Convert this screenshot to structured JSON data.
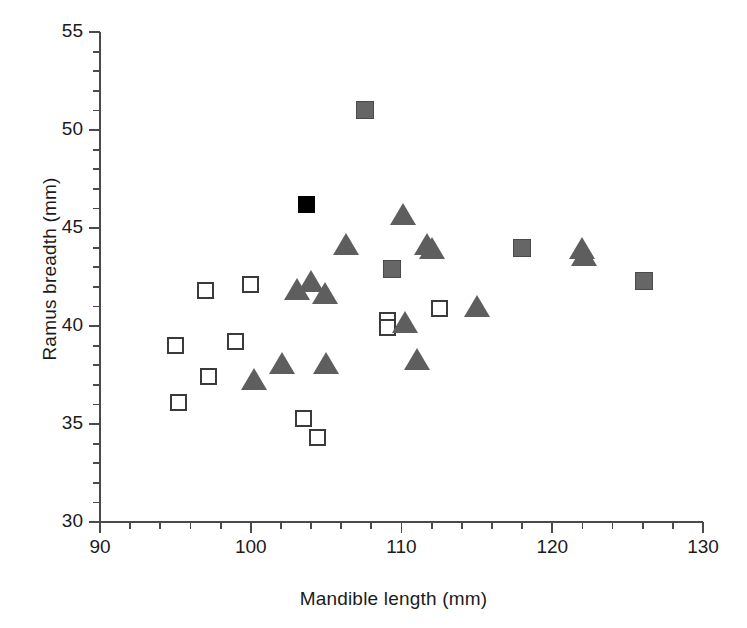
{
  "chart_data": {
    "type": "scatter",
    "title": "",
    "xlabel": "Mandible length (mm)",
    "ylabel": "Ramus breadth (mm)",
    "xlim": [
      90,
      130
    ],
    "ylim": [
      30,
      55
    ],
    "x_major_ticks": [
      90,
      100,
      110,
      120,
      130
    ],
    "x_minor_tick_interval": 2,
    "y_major_ticks": [
      30,
      35,
      40,
      45,
      50,
      55
    ],
    "y_minor_tick_interval": 1,
    "x_tick_labels": [
      "90",
      "100",
      "110",
      "120",
      "130"
    ],
    "y_tick_labels": [
      "30",
      "35",
      "40",
      "45",
      "50",
      "55"
    ],
    "grid": false,
    "legend": "none",
    "series": [
      {
        "name": "open-square",
        "marker": "square",
        "fill": "#ffffff",
        "edge": "#3a3a3a",
        "points": [
          [
            95.0,
            39.0
          ],
          [
            95.2,
            36.1
          ],
          [
            97.0,
            41.8
          ],
          [
            97.2,
            37.4
          ],
          [
            99.0,
            39.2
          ],
          [
            100.0,
            42.1
          ],
          [
            103.5,
            35.3
          ],
          [
            104.4,
            34.3
          ],
          [
            109.1,
            40.3
          ],
          [
            109.1,
            39.9
          ],
          [
            112.5,
            40.9
          ]
        ]
      },
      {
        "name": "gray-square",
        "marker": "square",
        "fill": "#666666",
        "edge": "#4a4a4a",
        "points": [
          [
            107.6,
            51.0
          ],
          [
            109.4,
            42.9
          ],
          [
            118.0,
            44.0
          ],
          [
            126.1,
            42.3
          ]
        ]
      },
      {
        "name": "black-square",
        "marker": "square",
        "fill": "#000000",
        "edge": "#000000",
        "points": [
          [
            103.7,
            46.2
          ]
        ]
      },
      {
        "name": "gray-triangle",
        "marker": "triangle",
        "fill": "#5e5e5e",
        "edge": "#4a4a4a",
        "points": [
          [
            100.2,
            37.3
          ],
          [
            102.1,
            38.1
          ],
          [
            103.1,
            41.9
          ],
          [
            104.0,
            42.3
          ],
          [
            104.9,
            41.7
          ],
          [
            105.0,
            38.1
          ],
          [
            106.3,
            44.2
          ],
          [
            110.1,
            45.7
          ],
          [
            110.2,
            40.2
          ],
          [
            111.0,
            38.3
          ],
          [
            111.7,
            44.2
          ],
          [
            112.0,
            44.0
          ],
          [
            115.0,
            41.0
          ],
          [
            122.0,
            44.0
          ],
          [
            122.1,
            43.6
          ]
        ]
      }
    ]
  },
  "axes": {
    "x_title": "Mandible length (mm)",
    "y_title": "Ramus breadth (mm)",
    "x_labels": [
      "90",
      "100",
      "110",
      "120",
      "130"
    ],
    "y_labels": [
      "55",
      "50",
      "45",
      "40",
      "35",
      "30"
    ]
  },
  "style": {
    "axis_color": "#4a4a4a",
    "text_color": "#1b1b1b",
    "open_marker_fill": "#ffffff",
    "open_marker_edge": "#3a3a3a",
    "gray_marker_fill": "#666666",
    "triangle_fill": "#5e5e5e",
    "black_marker_fill": "#000000",
    "background": "#ffffff"
  }
}
